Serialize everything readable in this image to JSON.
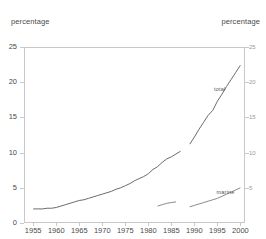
{
  "chart_data": {
    "type": "line",
    "title": "",
    "subtitle": "",
    "xlabel": "",
    "ylabel": "percentage",
    "y2label": "percentage",
    "xlim": [
      1953,
      2001
    ],
    "ylim": [
      0,
      25
    ],
    "grid": false,
    "legend_position": "inline-labels",
    "yticks": [
      0,
      5,
      10,
      15,
      20,
      25
    ],
    "ytick_labels": [
      "0",
      "5",
      "10",
      "15",
      "20",
      "25"
    ],
    "y2ticks": [
      5,
      10,
      15,
      20,
      25
    ],
    "y2tick_labels": [
      "5",
      "10",
      "15",
      "20",
      "25"
    ],
    "xticks": [
      1955,
      1960,
      1965,
      1970,
      1975,
      1980,
      1985,
      1990,
      1995,
      2000
    ],
    "xtick_labels": [
      "1955",
      "1960",
      "1965",
      "1970",
      "1975",
      "1980",
      "1985",
      "1990",
      "1995",
      "2000"
    ],
    "series": [
      {
        "name": "total",
        "color": "#6b6b6b",
        "x": [
          1955,
          1956,
          1957,
          1958,
          1959,
          1960,
          1961,
          1962,
          1963,
          1964,
          1965,
          1966,
          1967,
          1968,
          1969,
          1970,
          1971,
          1972,
          1973,
          1974,
          1975,
          1976,
          1977,
          1978,
          1979,
          1980,
          1981,
          1982,
          1983,
          1984,
          1985,
          1986,
          1987
        ],
        "values": [
          2.0,
          2.0,
          2.0,
          2.1,
          2.1,
          2.2,
          2.4,
          2.6,
          2.8,
          3.0,
          3.2,
          3.3,
          3.5,
          3.7,
          3.9,
          4.1,
          4.3,
          4.5,
          4.8,
          5.0,
          5.3,
          5.6,
          6.0,
          6.3,
          6.6,
          7.0,
          7.6,
          8.0,
          8.6,
          9.1,
          9.4,
          9.8,
          10.2
        ]
      },
      {
        "name": "total",
        "color": "#6b6b6b",
        "x": [
          1989,
          1990,
          1991,
          1992,
          1993,
          1994,
          1995,
          1996,
          1997,
          1998,
          1999,
          2000
        ],
        "values": [
          11.2,
          12.2,
          13.3,
          14.3,
          15.3,
          16.0,
          17.3,
          18.3,
          19.4,
          20.4,
          21.4,
          22.4
        ]
      },
      {
        "name": "marine",
        "color": "#8a8a8a",
        "x": [
          1982,
          1983,
          1984,
          1985,
          1986
        ],
        "values": [
          2.4,
          2.6,
          2.8,
          2.9,
          3.0
        ]
      },
      {
        "name": "marine",
        "color": "#8a8a8a",
        "x": [
          1989,
          1990,
          1991,
          1992,
          1993,
          1994,
          1995,
          1996,
          1997,
          1998,
          1999,
          2000
        ],
        "values": [
          2.3,
          2.5,
          2.7,
          2.9,
          3.1,
          3.3,
          3.5,
          3.8,
          4.1,
          4.4,
          4.7,
          5.0
        ]
      }
    ],
    "series_labels": [
      {
        "text": "total",
        "x": 1996,
        "y": 19.0
      },
      {
        "text": "marine",
        "x": 1997,
        "y": 4.4
      }
    ]
  }
}
